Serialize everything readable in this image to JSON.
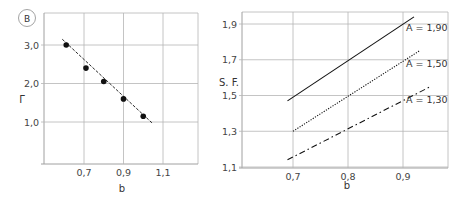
{
  "panel_label": "B",
  "chart_data": [
    {
      "type": "scatter",
      "title": "",
      "xlabel": "b",
      "ylabel": "Γ",
      "xlim": [
        0.5,
        1.2
      ],
      "ylim": [
        0.0,
        3.4
      ],
      "xticks": [
        "0,7",
        "0,9",
        "1,1"
      ],
      "xtick_values": [
        0.7,
        0.9,
        1.1
      ],
      "yticks": [
        "1,0",
        "2,0",
        "3,0"
      ],
      "ytick_values": [
        1.0,
        2.0,
        3.0
      ],
      "grid": true,
      "series": [
        {
          "name": "data",
          "style": "points",
          "x": [
            0.61,
            0.71,
            0.8,
            0.9,
            1.0
          ],
          "y": [
            3.0,
            2.4,
            2.05,
            1.6,
            1.15
          ]
        },
        {
          "name": "fit",
          "style": "dashed-line",
          "x": [
            0.59,
            1.05
          ],
          "y": [
            3.15,
            0.95
          ]
        }
      ]
    },
    {
      "type": "line",
      "title": "",
      "xlabel": "b",
      "ylabel": "S. F.",
      "xlim": [
        0.6,
        1.0
      ],
      "ylim": [
        1.1,
        1.98
      ],
      "xticks": [
        "0,7",
        "0,8",
        "0,9"
      ],
      "xtick_values": [
        0.7,
        0.8,
        0.9
      ],
      "yticks": [
        "1,1",
        "1,3",
        "1,5",
        "1,7",
        "1,9"
      ],
      "ytick_values": [
        1.1,
        1.3,
        1.5,
        1.7,
        1.9
      ],
      "grid": true,
      "series": [
        {
          "name": "A = 1,90",
          "style": "solid",
          "x": [
            0.69,
            0.92
          ],
          "y": [
            1.47,
            1.94
          ]
        },
        {
          "name": "A = 1,50",
          "style": "dotted",
          "x": [
            0.7,
            0.93
          ],
          "y": [
            1.3,
            1.75
          ]
        },
        {
          "name": "A = 1,30",
          "style": "dash-dot",
          "x": [
            0.69,
            0.95
          ],
          "y": [
            1.14,
            1.55
          ]
        }
      ]
    }
  ]
}
